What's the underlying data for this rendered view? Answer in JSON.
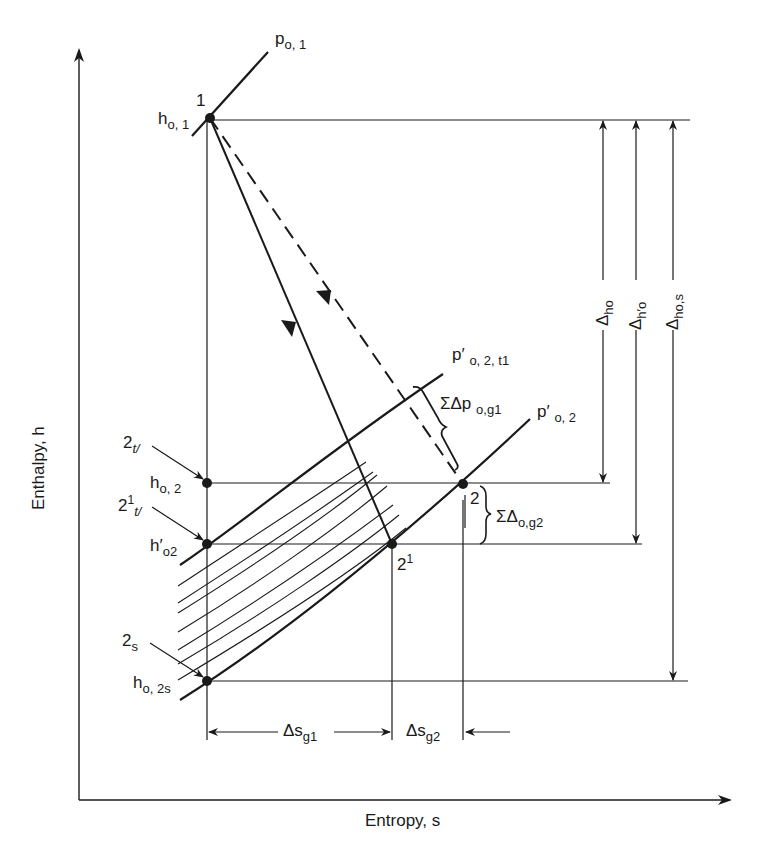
{
  "diagram": {
    "type": "h-s diagram (turbine stage expansion)",
    "axes": {
      "x_label": "Entropy, s",
      "y_label": "Enthalpy, h"
    },
    "points": [
      {
        "id": "1",
        "label": "1",
        "enthalpy_label_main": "h",
        "enthalpy_label_sub": "o, 1"
      },
      {
        "id": "2tl",
        "label_main": "2",
        "label_sub": "t/",
        "enthalpy_label_main": "h",
        "enthalpy_label_sub": "o, 2"
      },
      {
        "id": "2prime_tl",
        "label_main": "2",
        "label_sup": "1",
        "label_sub": "t/",
        "enthalpy_label_main": "h′",
        "enthalpy_label_sub": "o2"
      },
      {
        "id": "2s",
        "label_main": "2",
        "label_sub": "s",
        "enthalpy_label_main": "h",
        "enthalpy_label_sub": "o, 2s"
      },
      {
        "id": "2",
        "label": "2"
      },
      {
        "id": "2prime",
        "label_main": "2",
        "label_sup": "1"
      }
    ],
    "isobars": [
      {
        "id": "p_o1",
        "main": "p",
        "sub": "o, 1"
      },
      {
        "id": "p_prime_o2_t1",
        "main": "p′",
        "sub": "o, 2, t1"
      },
      {
        "id": "p_prime_o2",
        "main": "p′",
        "sub": "o, 2"
      }
    ],
    "annotations": {
      "sum_dp": {
        "main": "ΣΔp",
        "sub": "o,g1"
      },
      "sum_d": {
        "main": "ΣΔ",
        "sub": "o,g2"
      },
      "delta_ho": {
        "main": "Δ",
        "sub": "ho"
      },
      "delta_h_prime_o": {
        "main": "Δ",
        "sub": "h′o"
      },
      "delta_ho_s": {
        "main": "Δ",
        "sub": "ho,s"
      },
      "delta_s_g1": {
        "main": "Δs",
        "sub": "g1"
      },
      "delta_s_g2": {
        "main": "Δs",
        "sub": "g2"
      }
    },
    "colors": {
      "line": "#1a1a1a",
      "background": "#ffffff"
    }
  }
}
